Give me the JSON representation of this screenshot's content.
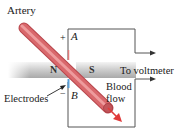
{
  "diagram": {
    "type": "electromagnetic blood flow meter",
    "labels": {
      "artery": "Artery",
      "electrodes": "Electrodes",
      "to_voltmeter": "To voltmeter",
      "blood_flow_line1": "Blood",
      "blood_flow_line2": "flow",
      "point_a": "A",
      "point_b": "B",
      "plus": "+",
      "minus": "−",
      "north_pole": "N",
      "south_pole": "S"
    },
    "colors": {
      "artery": "#d9686c",
      "artery_highlight": "#f2a5a6",
      "artery_dark": "#b8464c",
      "magnet": "#c9c9c9",
      "magnet_light": "#ececec",
      "wire": "#444444",
      "electrode": "#5aa0d8",
      "flow_arrow": "#e03a3a"
    }
  }
}
